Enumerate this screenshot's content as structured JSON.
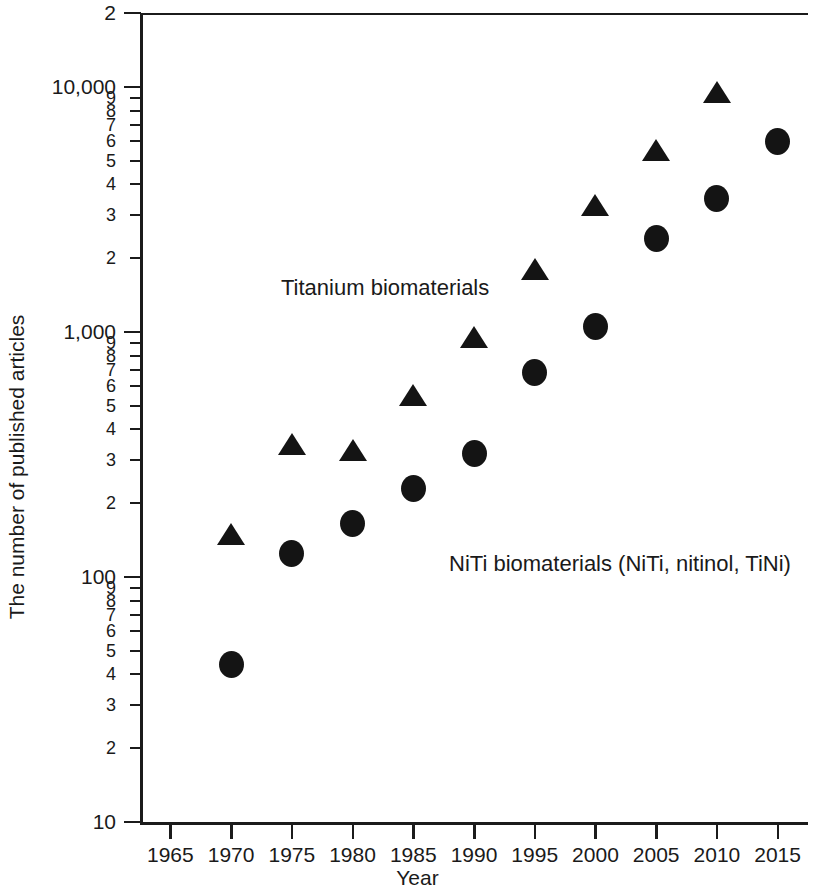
{
  "chart_data": {
    "type": "scatter",
    "title": "",
    "xlabel": "Year",
    "ylabel": "The number of published articles",
    "yscale": "log",
    "ylim": [
      10,
      20000
    ],
    "xlim": [
      1962.5,
      2017.5
    ],
    "grid": false,
    "legend_position": "inline-annotation",
    "x": [
      1965,
      1970,
      1975,
      1980,
      1985,
      1990,
      1995,
      2000,
      2005,
      2010,
      2015
    ],
    "series": [
      {
        "name": "Titanium biomaterials",
        "marker": "triangle",
        "color": "#141414",
        "x": [
          1970,
          1975,
          1980,
          1985,
          1990,
          1995,
          2000,
          2005,
          2010
        ],
        "values": [
          150,
          350,
          330,
          550,
          950,
          1800,
          3300,
          5500,
          9500
        ]
      },
      {
        "name": "NiTi biomaterials (NiTi, nitinol, TiNi)",
        "marker": "circle",
        "color": "#141414",
        "x": [
          1970,
          1975,
          1980,
          1985,
          1990,
          1995,
          2000,
          2005,
          2010,
          2015
        ],
        "values": [
          44,
          125,
          165,
          230,
          320,
          680,
          1050,
          2400,
          3500,
          6000
        ]
      }
    ],
    "annotations": [
      {
        "text": "Titanium biomaterials",
        "x": 1981,
        "y": 1400
      },
      {
        "text": "NiTi biomaterials (NiTi, nitinol, TiNi)",
        "x": 1995,
        "y": 120
      }
    ],
    "x_tick_labels": [
      "1965",
      "1970",
      "1975",
      "1980",
      "1985",
      "1990",
      "1995",
      "2000",
      "2005",
      "2010",
      "2015"
    ],
    "y_major_ticks": [
      {
        "value": 20000,
        "label": "2"
      },
      {
        "value": 10000,
        "label": "10,000"
      },
      {
        "value": 1000,
        "label": "1,000"
      },
      {
        "value": 100,
        "label": "100"
      },
      {
        "value": 10,
        "label": "10"
      }
    ],
    "y_minor_ticks": [
      {
        "value": 9000,
        "label": "9"
      },
      {
        "value": 8000,
        "label": "8"
      },
      {
        "value": 7000,
        "label": "7"
      },
      {
        "value": 6000,
        "label": "6"
      },
      {
        "value": 5000,
        "label": "5"
      },
      {
        "value": 4000,
        "label": "4"
      },
      {
        "value": 3000,
        "label": "3"
      },
      {
        "value": 2000,
        "label": "2"
      },
      {
        "value": 900,
        "label": "9"
      },
      {
        "value": 800,
        "label": "8"
      },
      {
        "value": 700,
        "label": "7"
      },
      {
        "value": 600,
        "label": "6"
      },
      {
        "value": 500,
        "label": "5"
      },
      {
        "value": 400,
        "label": "4"
      },
      {
        "value": 300,
        "label": "3"
      },
      {
        "value": 200,
        "label": "2"
      },
      {
        "value": 90,
        "label": "9"
      },
      {
        "value": 80,
        "label": "8"
      },
      {
        "value": 70,
        "label": "7"
      },
      {
        "value": 60,
        "label": "6"
      },
      {
        "value": 50,
        "label": "5"
      },
      {
        "value": 40,
        "label": "4"
      },
      {
        "value": 30,
        "label": "3"
      },
      {
        "value": 20,
        "label": "2"
      }
    ]
  }
}
